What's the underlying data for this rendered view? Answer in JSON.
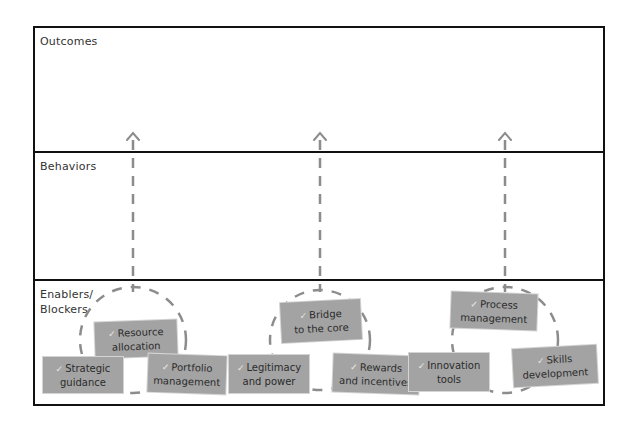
{
  "rows": [
    {
      "label": "Outcomes"
    },
    {
      "label": "Behaviors"
    },
    {
      "label": "Enablers/\nBlockers"
    }
  ],
  "groups": [
    {
      "cards": [
        {
          "line1": "Resource",
          "line2": "allocation"
        },
        {
          "line1": "Strategic",
          "line2": "guidance"
        },
        {
          "line1": "Portfolio",
          "line2": "management"
        }
      ]
    },
    {
      "cards": [
        {
          "line1": "Bridge",
          "line2": "to the core"
        },
        {
          "line1": "Legitimacy",
          "line2": "and power"
        },
        {
          "line1": "Rewards",
          "line2": "and incentives"
        }
      ]
    },
    {
      "cards": [
        {
          "line1": "Process",
          "line2": "management"
        },
        {
          "line1": "Innovation",
          "line2": "tools"
        },
        {
          "line1": "Skills",
          "line2": "development"
        }
      ]
    }
  ],
  "icons": {
    "check": "✓",
    "arrow": "arrow-up-icon"
  },
  "colors": {
    "card_fill": "#a3a3a3",
    "dash": "#8c8c8c",
    "frame": "#111111"
  }
}
